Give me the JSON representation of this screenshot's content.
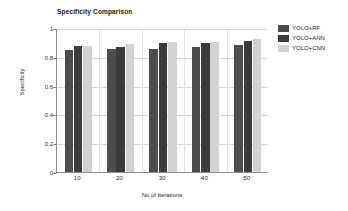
{
  "chart_data": {
    "type": "bar",
    "title": "Specificity Comparison",
    "xlabel": "No of Iterations",
    "ylabel": "Specificity",
    "categories": [
      "10",
      "20",
      "30",
      "40",
      "50"
    ],
    "ylim": [
      0,
      1
    ],
    "yticks": [
      "0",
      "0.2",
      "0.4",
      "0.6",
      "0.8",
      "1"
    ],
    "ytick_values": [
      0,
      0.2,
      0.4,
      0.6,
      0.8,
      1
    ],
    "grid": true,
    "legend_position": "right",
    "series": [
      {
        "name": "YOLO+RF",
        "color": "#4d4d4d",
        "values": [
          0.845,
          0.852,
          0.855,
          0.871,
          0.885
        ]
      },
      {
        "name": "YOLO+ANN",
        "color": "#3c3c3c",
        "values": [
          0.872,
          0.868,
          0.895,
          0.898,
          0.912
        ]
      },
      {
        "name": "YOLO+CNN",
        "color": "#d2d2d2",
        "values": [
          0.874,
          0.889,
          0.905,
          0.902,
          0.921
        ]
      }
    ]
  },
  "legend": {
    "items": [
      {
        "label": "YOLO+RF"
      },
      {
        "label": "YOLO+ANN"
      },
      {
        "label": "YOLO+CNN"
      }
    ]
  },
  "axes": {
    "y_title": "Specificity",
    "x_title": "No of Iterations"
  }
}
